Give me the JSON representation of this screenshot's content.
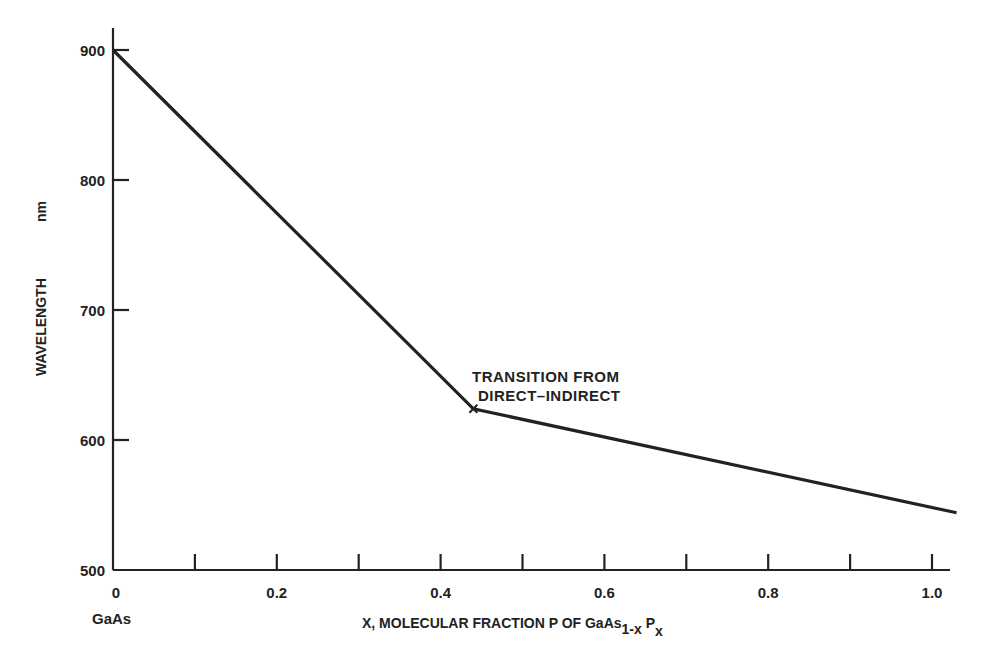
{
  "chart_data": {
    "type": "line",
    "title": "",
    "xlabel": "X, MOLECULAR FRACTION P OF GaAs1-x Px",
    "xlabel_parts": {
      "main": "X, MOLECULAR FRACTION P OF GaAs",
      "sub1": "1-x",
      "mid": " P",
      "sub2": "x"
    },
    "ylabel": "WAVELENGTH",
    "ylabel_unit": "nm",
    "xlim": [
      0,
      1.05
    ],
    "ylim": [
      500,
      920
    ],
    "x_ticks": [
      0,
      0.1,
      0.2,
      0.3,
      0.4,
      0.5,
      0.6,
      0.7,
      0.8,
      0.9,
      1.0
    ],
    "x_tick_labels": [
      "0",
      "0.2",
      "0.4",
      "0.6",
      "0.8",
      "1.0"
    ],
    "x_tick_label_values": [
      0,
      0.2,
      0.4,
      0.6,
      0.8,
      1.0
    ],
    "x_origin_sublabel": "GaAs",
    "y_ticks": [
      500,
      600,
      700,
      800,
      900
    ],
    "y_tick_labels": [
      "500",
      "600",
      "700",
      "800",
      "900"
    ],
    "grid": false,
    "legend": null,
    "series": [
      {
        "name": "Emission wavelength",
        "x": [
          0,
          0.44,
          1.03
        ],
        "y": [
          900,
          624,
          544
        ]
      }
    ],
    "annotations": [
      {
        "text_line1": "TRANSITION FROM",
        "text_line2": "DIRECT–INDIRECT",
        "x": 0.44,
        "y": 624,
        "marker": "x"
      }
    ]
  }
}
